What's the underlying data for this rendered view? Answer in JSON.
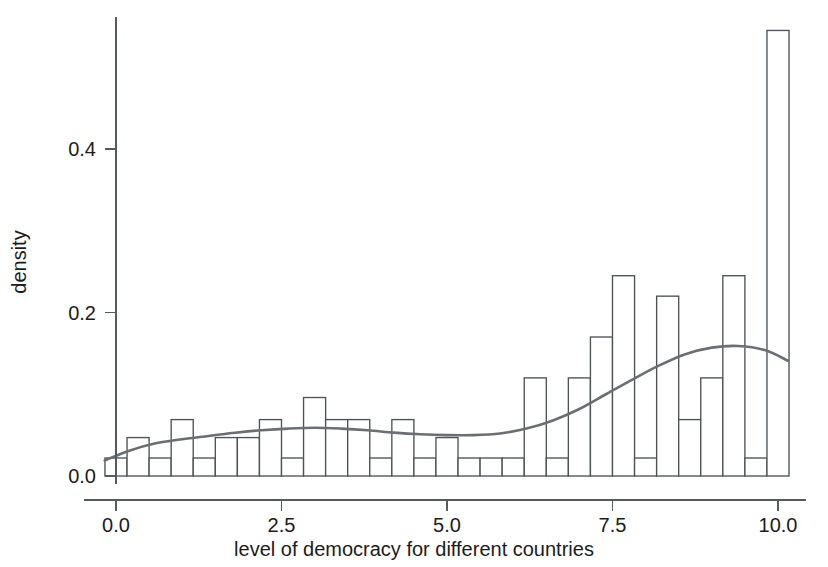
{
  "chart_data": {
    "type": "bar",
    "title": "",
    "subtitle": "",
    "xlabel": "level of democracy for different countries",
    "ylabel": "density",
    "xlim": [
      -0.17,
      10.34
    ],
    "ylim": [
      0.0,
      0.565
    ],
    "xticks": [
      0.0,
      2.5,
      5.0,
      7.5,
      10.0
    ],
    "xtick_labels": [
      "0.0",
      "2.5",
      "5.0",
      "7.5",
      "10.0"
    ],
    "yticks": [
      0.0,
      0.2,
      0.4
    ],
    "ytick_labels": [
      "0.0",
      "0.2",
      "0.4"
    ],
    "grid": false,
    "legend": "none",
    "bin_width": 0.3333,
    "bin_starts": [
      -0.1667,
      0.1667,
      0.5,
      0.8333,
      1.1667,
      1.5,
      1.8333,
      2.1667,
      2.5,
      2.8333,
      3.1667,
      3.5,
      3.8333,
      4.1667,
      4.5,
      4.8333,
      5.1667,
      5.5,
      5.8333,
      6.1667,
      6.5,
      6.8333,
      7.1667,
      7.5,
      7.8333,
      8.1667,
      8.5,
      8.8333,
      9.1667,
      9.5,
      9.8333
    ],
    "values": [
      0.022,
      0.047,
      0.022,
      0.069,
      0.022,
      0.047,
      0.047,
      0.069,
      0.022,
      0.096,
      0.069,
      0.069,
      0.022,
      0.069,
      0.022,
      0.047,
      0.022,
      0.022,
      0.022,
      0.12,
      0.022,
      0.12,
      0.17,
      0.245,
      0.022,
      0.22,
      0.069,
      0.12,
      0.245,
      0.022,
      0.545
    ],
    "series": [
      {
        "name": "histogram",
        "type": "bar",
        "values": [
          0.022,
          0.047,
          0.022,
          0.069,
          0.022,
          0.047,
          0.047,
          0.069,
          0.022,
          0.096,
          0.069,
          0.069,
          0.022,
          0.069,
          0.022,
          0.047,
          0.022,
          0.022,
          0.022,
          0.12,
          0.022,
          0.12,
          0.17,
          0.245,
          0.022,
          0.22,
          0.069,
          0.12,
          0.245,
          0.022,
          0.545
        ]
      },
      {
        "name": "density",
        "type": "line",
        "x": [
          -0.17,
          0.2,
          0.6,
          1.0,
          1.4,
          1.8,
          2.2,
          2.6,
          3.0,
          3.4,
          3.8,
          4.2,
          4.6,
          5.0,
          5.4,
          5.8,
          6.2,
          6.6,
          7.0,
          7.4,
          7.8,
          8.2,
          8.6,
          9.0,
          9.4,
          9.8,
          10.15
        ],
        "y": [
          0.019,
          0.031,
          0.04,
          0.045,
          0.049,
          0.053,
          0.056,
          0.058,
          0.059,
          0.058,
          0.056,
          0.053,
          0.051,
          0.05,
          0.05,
          0.052,
          0.058,
          0.068,
          0.082,
          0.1,
          0.118,
          0.135,
          0.149,
          0.157,
          0.159,
          0.154,
          0.141
        ]
      }
    ]
  },
  "colors": {
    "background": "#ffffff",
    "axis": "#555a5e",
    "bar_stroke": "#4d5256",
    "bar_fill": "#ffffff",
    "curve": "#6a6f73",
    "text": "#1c1c1c"
  }
}
